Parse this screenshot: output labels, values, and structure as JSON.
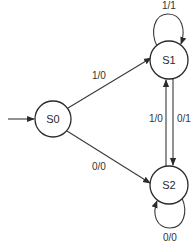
{
  "diagram": {
    "type": "finite-state-machine",
    "colors": {
      "stroke": "#2a2a2a",
      "text": "#333333",
      "background": "#ffffff"
    },
    "states": [
      {
        "id": "S0",
        "label": "S0",
        "initial": true
      },
      {
        "id": "S1",
        "label": "S1"
      },
      {
        "id": "S2",
        "label": "S2"
      }
    ],
    "transitions": [
      {
        "from": "S0",
        "to": "S1",
        "label": "1/0"
      },
      {
        "from": "S0",
        "to": "S2",
        "label": "0/0"
      },
      {
        "from": "S1",
        "to": "S1",
        "label": "1/1"
      },
      {
        "from": "S1",
        "to": "S2",
        "label": "0/1"
      },
      {
        "from": "S2",
        "to": "S1",
        "label": "1/0"
      },
      {
        "from": "S2",
        "to": "S2",
        "label": "0/0"
      }
    ]
  }
}
